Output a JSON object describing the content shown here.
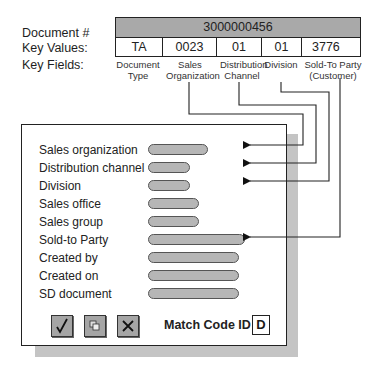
{
  "header_labels": {
    "document": "Document #",
    "key_values": "Key Values:",
    "key_fields": "Key Fields:"
  },
  "key_table": {
    "document_number": "3000000456",
    "values": [
      "TA",
      "0023",
      "01",
      "01",
      "3776"
    ],
    "field_names": [
      [
        "Document",
        "Type"
      ],
      [
        "Sales",
        "Organization"
      ],
      [
        "Distribution",
        "Channel"
      ],
      [
        "Division",
        ""
      ],
      [
        "Sold-To Party",
        "(Customer)"
      ]
    ]
  },
  "dialog": {
    "fields": [
      {
        "label": "Sales organization",
        "linked": true
      },
      {
        "label": "Distribution channel",
        "linked": true
      },
      {
        "label": "Division",
        "linked": true
      },
      {
        "label": "Sales office",
        "linked": false
      },
      {
        "label": "Sales group",
        "linked": false
      },
      {
        "label": "Sold-to Party",
        "linked": true
      },
      {
        "label": "Created by",
        "linked": false
      },
      {
        "label": "Created on",
        "linked": false
      },
      {
        "label": "SD document",
        "linked": false
      }
    ],
    "buttons": [
      {
        "name": "confirm",
        "icon": "checkmark-icon"
      },
      {
        "name": "copy",
        "icon": "copy-icon"
      },
      {
        "name": "cancel",
        "icon": "close-icon"
      }
    ],
    "match_code_label": "Match Code ID",
    "match_code_value": "D"
  }
}
